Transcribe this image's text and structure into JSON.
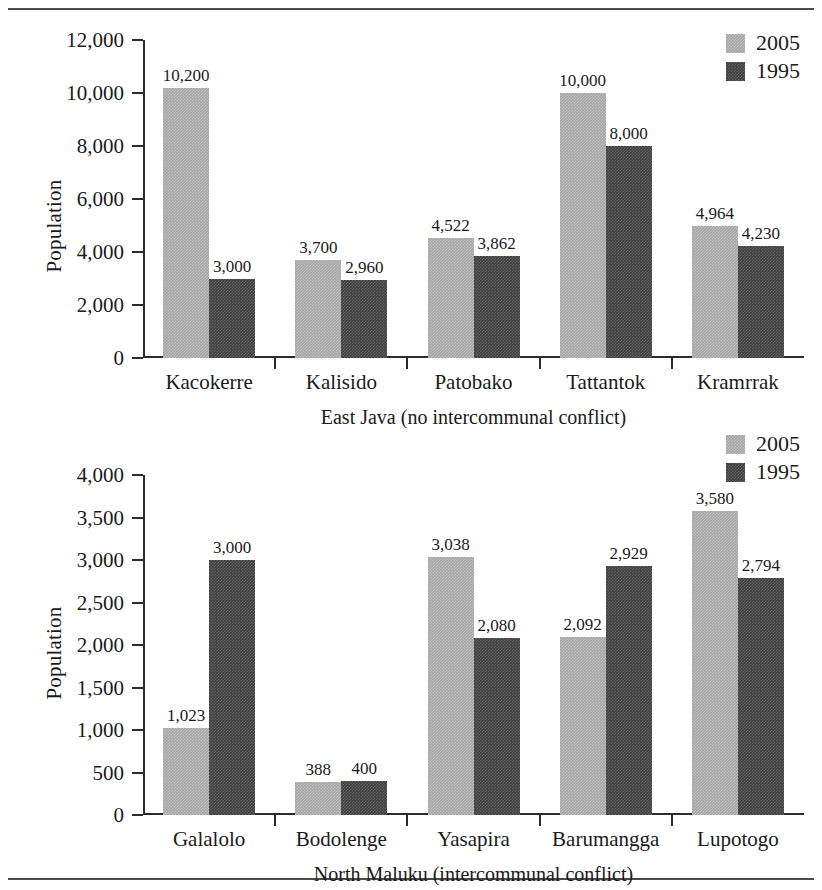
{
  "series_colors": {
    "y2005": "#a5a5a5",
    "y1995": "#3f3f3f"
  },
  "chart_data": [
    {
      "type": "bar",
      "title": "",
      "xlabel": "East Java (no intercommunal conflict)",
      "ylabel": "Population",
      "categories": [
        "Kacokerre",
        "Kalisido",
        "Patobako",
        "Tattantok",
        "Kramrrak"
      ],
      "series": [
        {
          "name": "2005",
          "values": [
            10200,
            3700,
            4522,
            10000,
            4964
          ],
          "labels": [
            "10,200",
            "3,700",
            "4,522",
            "10,000",
            "4,964"
          ]
        },
        {
          "name": "1995",
          "values": [
            3000,
            2960,
            3862,
            8000,
            4230
          ],
          "labels": [
            "3,000",
            "2,960",
            "3,862",
            "8,000",
            "4,230"
          ]
        }
      ],
      "ylim": [
        0,
        12000
      ],
      "yticks": [
        0,
        2000,
        4000,
        6000,
        8000,
        10000,
        12000
      ],
      "ytick_labels": [
        "0",
        "2,000",
        "4,000",
        "6,000",
        "8,000",
        "10,000",
        "12,000"
      ],
      "grid": false,
      "legend_position": "top-right",
      "legend": [
        "2005",
        "1995"
      ]
    },
    {
      "type": "bar",
      "title": "",
      "xlabel": "North Maluku (intercommunal conflict)",
      "ylabel": "Population",
      "categories": [
        "Galalolo",
        "Bodolenge",
        "Yasapira",
        "Barumangga",
        "Lupotogo"
      ],
      "series": [
        {
          "name": "2005",
          "values": [
            1023,
            388,
            3038,
            2092,
            3580
          ],
          "labels": [
            "1,023",
            "388",
            "3,038",
            "2,092",
            "3,580"
          ]
        },
        {
          "name": "1995",
          "values": [
            3000,
            400,
            2080,
            2929,
            2794
          ],
          "labels": [
            "3,000",
            "400",
            "2,080",
            "2,929",
            "2,794"
          ]
        }
      ],
      "ylim": [
        0,
        4000
      ],
      "yticks": [
        0,
        500,
        1000,
        1500,
        2000,
        2500,
        3000,
        3500,
        4000
      ],
      "ytick_labels": [
        "0",
        "500",
        "1,000",
        "1,500",
        "2,000",
        "2,500",
        "3,000",
        "3,500",
        "4,000"
      ],
      "grid": false,
      "legend_position": "top-right",
      "legend": [
        "2005",
        "1995"
      ]
    }
  ]
}
